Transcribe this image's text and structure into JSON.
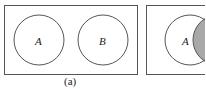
{
  "diagrams": [
    {
      "id": "a",
      "caption": "(a)",
      "sets": [
        {
          "label": "A",
          "shaded": false
        },
        {
          "label": "B",
          "shaded": false
        }
      ],
      "relation": "disjoint"
    },
    {
      "id": "b",
      "caption": "",
      "sets": [
        {
          "label": "A",
          "shaded": false
        },
        {
          "label": "",
          "shaded": true
        }
      ],
      "relation": "overlapping (partially cropped)"
    }
  ],
  "colors": {
    "stroke": "#555555",
    "shade": "#a8a8a8",
    "background": "#ffffff"
  }
}
